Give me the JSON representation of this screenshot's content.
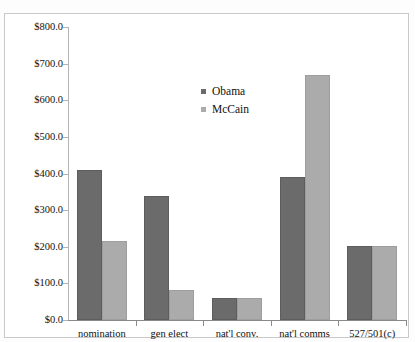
{
  "chart_data": {
    "type": "bar",
    "title": "",
    "xlabel": "",
    "ylabel": "",
    "ylim": [
      0,
      800
    ],
    "ytick_values": [
      800,
      700,
      600,
      500,
      400,
      300,
      200,
      100,
      0
    ],
    "ytick_labels": [
      "$800.0",
      "$700.0",
      "$600.0",
      "$500.0",
      "$400.0",
      "$300.0",
      "$200.0",
      "$100.0",
      "$0.0"
    ],
    "grid": false,
    "legend_position": "upper-center",
    "categories": [
      "nomination",
      "gen elect",
      "nat'l conv.",
      "nat'l comms",
      "527/501(c)"
    ],
    "series": [
      {
        "name": "Obama",
        "color": "#6b6b6b",
        "values": [
          410.0,
          339.0,
          60.0,
          390.0,
          202.0
        ]
      },
      {
        "name": "McCain",
        "color": "#ababab",
        "values": [
          216.0,
          83.0,
          60.0,
          669.0,
          202.0
        ]
      }
    ]
  },
  "legend": {
    "entries": [
      {
        "label": "Obama",
        "swatch": "legend-swatch-obama"
      },
      {
        "label": "McCain",
        "swatch": "legend-swatch-mccain"
      }
    ]
  },
  "colors": {
    "obama": "#6b6b6b",
    "mccain": "#ababab",
    "axis": "#8a8a8a",
    "frame": "#c9c9c9",
    "background": "#ffffff"
  }
}
